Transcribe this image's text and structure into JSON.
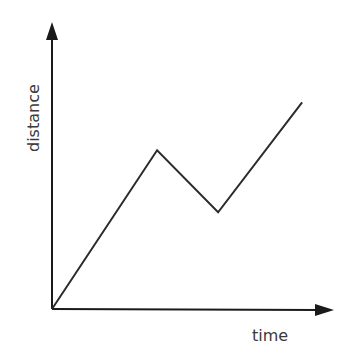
{
  "chart_data": {
    "type": "line",
    "title": "",
    "xlabel": "time",
    "ylabel": "distance",
    "grid": false,
    "legend": null,
    "ticks": {
      "x": [],
      "y": []
    },
    "series": [
      {
        "name": "distance-time",
        "points": [
          {
            "x": 0,
            "y": 0
          },
          {
            "x": 37.4,
            "y": 55.3
          },
          {
            "x": 59.1,
            "y": 33.7
          },
          {
            "x": 89.0,
            "y": 72.0
          }
        ]
      }
    ],
    "xlim": [
      0,
      100
    ],
    "ylim": [
      0,
      100
    ],
    "colors": {
      "line": "#2b2b2b",
      "axes": "#1a1a1a",
      "text": "#3a3a3a"
    }
  },
  "axes": {
    "x_label": "time",
    "y_label": "distance"
  }
}
